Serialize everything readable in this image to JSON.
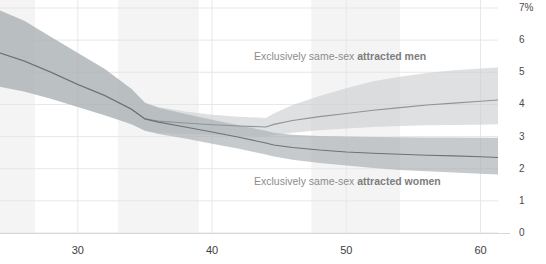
{
  "chart_data": {
    "type": "line",
    "title": "",
    "xlabel": "",
    "ylabel": "",
    "xlim": [
      24.2,
      61.3
    ],
    "ylim": [
      0,
      7
    ],
    "grid": true,
    "legend_position": "inline-annotation",
    "yticks": [
      "7%",
      "6",
      "5",
      "4",
      "3",
      "2",
      "1",
      "0"
    ],
    "ytick_values": [
      7,
      6,
      5,
      4,
      3,
      2,
      1,
      0
    ],
    "xticks": [
      "30",
      "40",
      "50",
      "60"
    ],
    "xtick_values": [
      30,
      40,
      50,
      60
    ],
    "colors": {
      "men_band": "#c9cdd0",
      "men_line": "#8e9498",
      "women_band": "#a9aeb2",
      "women_line": "#6c7276",
      "gridline": "#e4e4e4",
      "vertical_band": "#f4f4f5",
      "axis_text": "#3d3d3d",
      "annotation_text": "#8c8c8c"
    },
    "vertical_shaded_bands": [
      {
        "x_start": 24.2,
        "x_end": 26.8
      },
      {
        "x_start": 33.0,
        "x_end": 39.0
      },
      {
        "x_start": 47.4,
        "x_end": 54.0
      }
    ],
    "series": [
      {
        "name": "Exclusively same-sex attracted men",
        "label_bold_part": "attracted men",
        "label_plain_part": "Exclusively same-sex ",
        "x": [
          24.2,
          26,
          28,
          30,
          32,
          34,
          35,
          36,
          38,
          40,
          42,
          44,
          44.6,
          46,
          48,
          50,
          52,
          54,
          56,
          58,
          60,
          61.3
        ],
        "values": [
          5.6,
          5.35,
          5.0,
          4.62,
          4.28,
          3.85,
          3.55,
          3.48,
          3.42,
          3.37,
          3.33,
          3.3,
          3.38,
          3.5,
          3.62,
          3.72,
          3.82,
          3.9,
          3.98,
          4.04,
          4.1,
          4.14
        ],
        "band_upper": [
          6.92,
          6.6,
          6.1,
          5.6,
          5.1,
          4.48,
          4.05,
          3.92,
          3.78,
          3.68,
          3.62,
          3.58,
          3.72,
          3.98,
          4.26,
          4.5,
          4.72,
          4.86,
          4.98,
          5.06,
          5.12,
          5.15
        ],
        "band_lower": [
          4.55,
          4.4,
          4.18,
          3.92,
          3.66,
          3.38,
          3.18,
          3.12,
          3.08,
          3.05,
          3.02,
          3.0,
          3.05,
          3.12,
          3.2,
          3.25,
          3.3,
          3.33,
          3.35,
          3.36,
          3.37,
          3.38
        ]
      },
      {
        "name": "Exclusively same-sex attracted women",
        "label_bold_part": "attracted women",
        "label_plain_part": "Exclusively same-sex ",
        "x": [
          24.2,
          26,
          28,
          30,
          32,
          34,
          35,
          36,
          38,
          40,
          42,
          44,
          44.6,
          46,
          48,
          50,
          52,
          54,
          56,
          58,
          60,
          61.3
        ],
        "values": [
          5.6,
          5.35,
          5.0,
          4.62,
          4.28,
          3.85,
          3.55,
          3.45,
          3.3,
          3.14,
          2.98,
          2.8,
          2.74,
          2.66,
          2.58,
          2.52,
          2.48,
          2.45,
          2.42,
          2.4,
          2.37,
          2.35
        ],
        "band_upper": [
          6.92,
          6.6,
          6.1,
          5.6,
          5.1,
          4.48,
          4.05,
          3.9,
          3.7,
          3.52,
          3.35,
          3.18,
          3.12,
          3.06,
          3.02,
          3.0,
          2.99,
          2.98,
          2.97,
          2.97,
          2.96,
          2.96
        ],
        "band_lower": [
          4.55,
          4.4,
          4.18,
          3.92,
          3.66,
          3.38,
          3.18,
          3.08,
          2.94,
          2.78,
          2.62,
          2.44,
          2.38,
          2.28,
          2.18,
          2.1,
          2.02,
          1.96,
          1.92,
          1.88,
          1.84,
          1.82
        ]
      }
    ]
  },
  "annotations": {
    "men_label_plain": "Exclusively same-sex ",
    "men_label_bold": "attracted men",
    "women_label_plain": "Exclusively same-sex ",
    "women_label_bold": "attracted women"
  },
  "axis": {
    "y_labels": [
      "7%",
      "6",
      "5",
      "4",
      "3",
      "2",
      "1",
      "0"
    ],
    "x_labels": [
      "30",
      "40",
      "50",
      "60"
    ]
  }
}
